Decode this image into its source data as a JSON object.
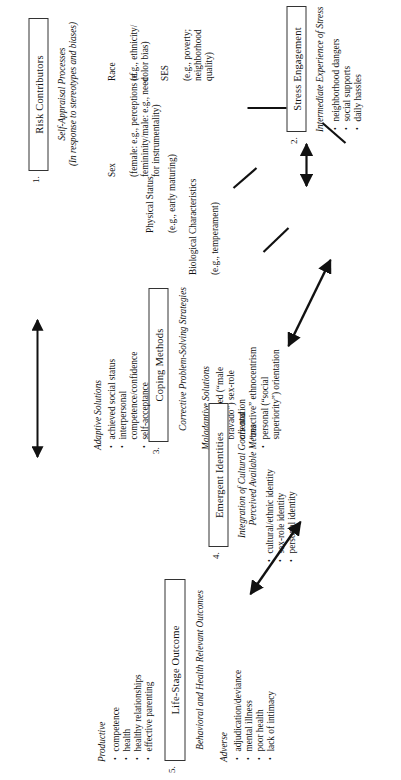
{
  "figure": {
    "type": "flow-diagram",
    "orientation": "rotated-90-ccw",
    "nodes": [
      {
        "number": "1.",
        "title": "Risk Contributors",
        "caption": "Self-Appraisal Processes\n(In response to stereotypes and biases)",
        "items": [
          {
            "label": "Race",
            "detail": "(e.g., ethnicity/\ncolor bias)"
          },
          {
            "label": "SES",
            "detail": "(e.g., poverty;\nneighborhood quality)"
          },
          {
            "label": "Sex",
            "detail": "(female: e.g., perceptions of\nfemininity/male: e.g., need\nfor instrumentality)"
          },
          {
            "label": "Physical Status",
            "detail": "(e.g., early maturing)"
          },
          {
            "label": "Biological Characteristics",
            "detail": "(e.g., temperament)"
          }
        ]
      },
      {
        "number": "2.",
        "title": "Stress Engagement",
        "caption": "Intermediate Experience of Stress",
        "bullets": [
          "neighborhood dangers",
          "social supports",
          "daily hassles"
        ]
      },
      {
        "number": "3.",
        "title": "Coping Methods",
        "caption": "Corrective Problem-Solving Strategies",
        "groups": [
          {
            "heading": "Maladaptive Solutions",
            "bullets": [
              "exaggerated (“male bravado”) sex-role orientation",
              "“reactive” ethnocentrism",
              "personal (“social superiority”) orientation"
            ]
          },
          {
            "heading": "Adaptive Solutions",
            "bullets": [
              "achieved social status",
              "interpersonal competence/confidence",
              "self-acceptance"
            ]
          }
        ]
      },
      {
        "number": "4.",
        "title": "Emergent Identities",
        "caption": "Integration of Cultural Goals and\nPerceived Available Means",
        "bullets": [
          "cultural/ethnic identity",
          "sex-role identity",
          "personal identity"
        ]
      },
      {
        "number": "5.",
        "title": "Life-Stage Outcome",
        "caption": "Behavioral and Health Relevant Outcomes",
        "groups": [
          {
            "heading": "Adverse",
            "bullets": [
              "adjudication/deviance",
              "mental illness",
              "poor health",
              "lack of intimacy"
            ]
          },
          {
            "heading": "Productive",
            "bullets": [
              "competence",
              "health",
              "healthy relationships",
              "effective parenting"
            ]
          }
        ]
      }
    ],
    "colors": {
      "ink": "#111111",
      "border": "#333333",
      "background": "#ffffff"
    }
  }
}
